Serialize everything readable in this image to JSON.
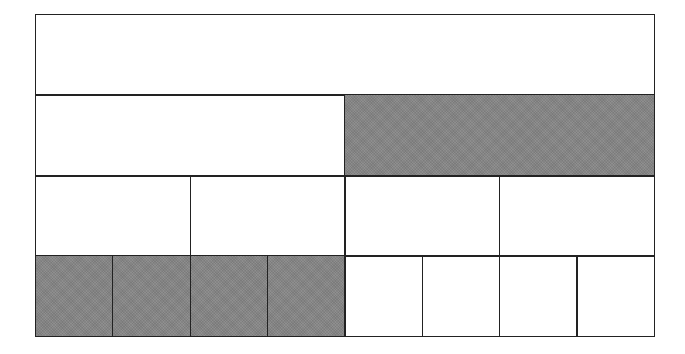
{
  "diagram": {
    "type": "fraction-bars",
    "colors": {
      "shaded": "#858585",
      "unshaded": "#ffffff",
      "border": "#222222"
    },
    "rows": [
      {
        "name": "whole",
        "denominator": 1,
        "shaded": [
          false
        ]
      },
      {
        "name": "halves",
        "denominator": 2,
        "shaded": [
          false,
          true
        ]
      },
      {
        "name": "quarters",
        "denominator": 4,
        "shaded": [
          false,
          false,
          false,
          false
        ]
      },
      {
        "name": "eighths",
        "denominator": 8,
        "shaded": [
          true,
          true,
          true,
          true,
          false,
          false,
          false,
          false
        ]
      }
    ]
  }
}
